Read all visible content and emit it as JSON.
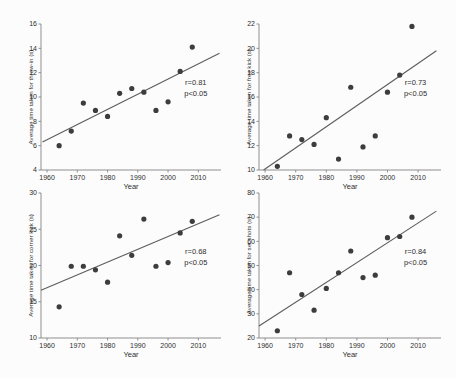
{
  "figure": {
    "background_color": "#fcfcfc",
    "point_color": "#3d3d3d",
    "trend_color": "#5c5c5c",
    "axis_color": "#8f8f8f",
    "text_color": "#2e2e2e"
  },
  "chart_data": [
    {
      "id": "throw-in",
      "type": "scatter",
      "xlabel": "Year",
      "ylabel": "Average time taken for throw-in (s)",
      "xlim": [
        1958,
        2017.5
      ],
      "ylim": [
        4,
        16
      ],
      "xticks": [
        1960,
        1970,
        1980,
        1990,
        2000,
        2010
      ],
      "yticks": [
        4,
        6,
        8,
        10,
        12,
        14,
        16
      ],
      "x": [
        1964,
        1968,
        1972,
        1976,
        1980,
        1984,
        1988,
        1992,
        1996,
        2000,
        2004,
        2008
      ],
      "values": [
        6.0,
        7.2,
        9.5,
        8.9,
        8.4,
        10.3,
        10.7,
        10.4,
        8.9,
        9.6,
        12.1,
        14.1
      ],
      "trendline": {
        "x1": 1958.5,
        "y1": 6.3,
        "x2": 2017,
        "y2": 13.6
      },
      "annotation": {
        "r": "r=0.81",
        "p": "p<0.05"
      },
      "legend": "none",
      "grid": false
    },
    {
      "id": "free-kick",
      "type": "scatter",
      "xlabel": "Year",
      "ylabel": "Average time taken for free kick (s)",
      "xlim": [
        1958,
        2017.5
      ],
      "ylim": [
        10,
        22
      ],
      "xticks": [
        1960,
        1970,
        1980,
        1990,
        2000,
        2010
      ],
      "yticks": [
        10,
        12,
        14,
        16,
        18,
        20,
        22
      ],
      "x": [
        1964,
        1968,
        1972,
        1976,
        1980,
        1984,
        1988,
        1992,
        1996,
        2000,
        2004,
        2008
      ],
      "values": [
        10.3,
        12.8,
        12.5,
        12.1,
        14.3,
        10.9,
        16.8,
        11.9,
        12.8,
        16.4,
        17.8,
        21.8
      ],
      "trendline": {
        "x1": 1959.5,
        "y1": 10.0,
        "x2": 2016,
        "y2": 19.8
      },
      "annotation": {
        "r": "r=0.73",
        "p": "p<0.05"
      },
      "legend": "none",
      "grid": false
    },
    {
      "id": "corner-kick",
      "type": "scatter",
      "xlabel": "Year",
      "ylabel": "Average time taken for corner kick (s)",
      "xlim": [
        1958,
        2017.5
      ],
      "ylim": [
        10,
        30
      ],
      "xticks": [
        1960,
        1970,
        1980,
        1990,
        2000,
        2010
      ],
      "yticks": [
        10,
        15,
        20,
        25,
        30
      ],
      "x": [
        1964,
        1968,
        1972,
        1976,
        1980,
        1984,
        1988,
        1992,
        1996,
        2000,
        2004,
        2008
      ],
      "values": [
        14.3,
        19.9,
        19.9,
        19.4,
        17.7,
        24.1,
        21.4,
        26.4,
        19.9,
        20.4,
        24.5,
        26.1
      ],
      "trendline": {
        "x1": 1958,
        "y1": 16.6,
        "x2": 2017,
        "y2": 27.0
      },
      "annotation": {
        "r": "r=0.68",
        "p": "p<0.05"
      },
      "legend": "none",
      "grid": false
    },
    {
      "id": "set-shots",
      "type": "scatter",
      "xlabel": "Year",
      "ylabel": "Average time taken for set shots (s)",
      "xlim": [
        1958,
        2017.5
      ],
      "ylim": [
        20,
        80
      ],
      "xticks": [
        1960,
        1970,
        1980,
        1990,
        2000,
        2010
      ],
      "yticks": [
        20,
        30,
        40,
        50,
        60,
        70,
        80
      ],
      "x": [
        1964,
        1968,
        1972,
        1976,
        1980,
        1984,
        1988,
        1992,
        1996,
        2000,
        2004,
        2008
      ],
      "values": [
        23,
        47,
        38,
        31.5,
        40.5,
        47,
        56,
        45,
        46,
        61.5,
        62,
        70
      ],
      "trendline": {
        "x1": 1958,
        "y1": 25.0,
        "x2": 2016,
        "y2": 72.5
      },
      "annotation": {
        "r": "r=0.84",
        "p": "p<0.05"
      },
      "legend": "none",
      "grid": false
    }
  ]
}
